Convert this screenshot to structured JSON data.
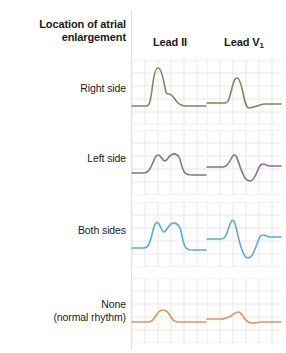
{
  "header": {
    "row_header": "Location of atrial\nenlargement",
    "row_header_line1": "Location of atrial",
    "row_header_line2": "enlargement",
    "columns": [
      {
        "id": "lead-ii",
        "label": "Lead II",
        "sub": ""
      },
      {
        "id": "lead-v1",
        "label": "Lead V",
        "sub": "1"
      }
    ]
  },
  "grid": {
    "cell_px": 13,
    "line_color": "#e8e8e8",
    "divider_color": "#e2e2e2",
    "cell_width": 74,
    "cell_height": 65
  },
  "rows": [
    {
      "id": "right-side",
      "label": "Right side",
      "label_line1": "Right side",
      "label_line2": "",
      "color": "#7b8a5c",
      "top": 60,
      "label_top": 82,
      "lead_ii": {
        "description": "tall peaked P wave (P pulmonale), increased amplitude, normal duration",
        "path": "M0,46 L14,46 C17,46 18,44 20,30 C22,12 24,8 26,8 C29,8 31,16 33,28 C34,34 35,34 37,34 C40,34 42,38 45,42 C48,45 50,46 54,46 L74,46"
      },
      "lead_v1": {
        "description": "tall positive initial deflection, small terminal negative component",
        "path": "M0,43 L18,43 C21,43 22,40 25,28 C27,20 28,18 30,18 C32,18 34,23 36,33 C38,42 39,48 42,48 C45,48 47,47 50,46 C53,45 55,44 58,44 L74,44"
      }
    },
    {
      "id": "left-side",
      "label": "Left side",
      "label_line1": "Left side",
      "label_line2": "",
      "color": "#8a6f8e",
      "top": 130,
      "label_top": 152,
      "lead_ii": {
        "description": "bifid notched M-shaped P wave (P mitrale), prolonged duration, normal amplitude",
        "path": "M0,43 L12,43 C16,43 18,40 22,30 C24,25 26,24 28,26 C30,28 31,31 33,31 C35,31 36,27 39,25 C42,23 45,24 47,27 C49,31 50,40 53,43 C55,45 57,45 60,45 L74,45"
      },
      "lead_v1": {
        "description": "biphasic P wave with small positive then deep wide negative terminal deflection",
        "path": "M0,37 L16,37 C19,37 21,35 24,29 C26,25 27,24 29,26 C31,29 33,38 36,44 C38,49 40,51 43,51 C46,51 48,47 50,42 C52,37 53,34 56,34 C59,34 60,36 62,36 L74,36"
      }
    },
    {
      "id": "both-sides",
      "label": "Both sides",
      "label_line1": "Both sides",
      "label_line2": "",
      "color": "#5fa8dc",
      "top": 202,
      "label_top": 224,
      "lead_ii": {
        "description": "tall and wide bifid P wave, increased amplitude and prolonged duration",
        "path": "M0,46 L12,46 C16,46 18,42 21,28 C23,20 25,19 27,22 C29,25 30,30 32,30 C34,30 36,24 39,22 C43,20 46,22 48,26 C50,31 51,43 54,46 C56,48 58,48 61,48 L74,48"
      },
      "lead_v1": {
        "description": "large biphasic P wave, tall positive peak with deep wide negative trough",
        "path": "M0,37 L14,37 C18,37 19,34 22,25 C24,19 25,17 27,19 C29,22 31,36 34,45 C36,52 38,56 41,56 C45,56 47,50 50,42 C52,36 53,33 56,33 C59,33 60,35 63,35 L74,35"
      }
    },
    {
      "id": "none-normal",
      "label": "None (normal rhythm)",
      "label_line1": "None",
      "label_line2": "(normal rhythm)",
      "color": "#d9955f",
      "top": 278,
      "label_top": 298,
      "lead_ii": {
        "description": "small smooth rounded upright P wave, normal amplitude and duration",
        "path": "M0,44 L16,44 C20,44 22,41 25,36 C27,33 29,32 31,32 C33,32 35,33 37,36 C40,41 42,44 46,44 L74,44"
      },
      "lead_v1": {
        "description": "small smooth rounded P wave with slight terminal negative deflection",
        "path": "M0,41 L14,41 C18,41 20,40 24,38 C26,37 28,34 31,34 C34,34 36,38 38,41 C40,44 42,45 46,45 C49,45 51,44 54,44 L74,44"
      }
    }
  ]
}
